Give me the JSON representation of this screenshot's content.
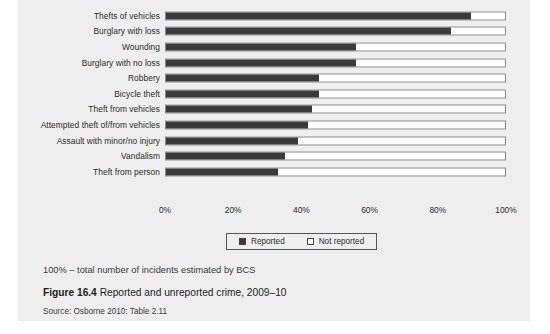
{
  "figure": {
    "note": "100% – total number of incidents estimated by BCS",
    "caption_number": "Figure 16.4",
    "caption_text": " Reported and unreported crime, 2009–10",
    "source": "Source: Osborne 2010: Table 2.11"
  },
  "legend": {
    "reported_label": "Reported",
    "not_reported_label": "Not reported"
  },
  "colors": {
    "reported": "#3b3b3b",
    "not_reported": "#ffffff",
    "panel": "#eeeeee",
    "bar_border": "#8a8a8a"
  },
  "chart_data": {
    "type": "bar",
    "orientation": "horizontal",
    "stacked": true,
    "title": "",
    "xlabel": "",
    "ylabel": "",
    "xlim": [
      0,
      100
    ],
    "grid": false,
    "legend_position": "bottom",
    "xticks": [
      "0%",
      "20%",
      "40%",
      "60%",
      "80%",
      "100%"
    ],
    "xtick_values": [
      0,
      20,
      40,
      60,
      80,
      100
    ],
    "categories": [
      "Thefts of vehicles",
      "Burglary with loss",
      "Wounding",
      "Burglary with no loss",
      "Robbery",
      "Bicycle theft",
      "Theft from vehicles",
      "Attempted theft of/from vehicles",
      "Assault with minor/no injury",
      "Vandalism",
      "Theft from person"
    ],
    "series": [
      {
        "name": "Reported",
        "values": [
          90,
          84,
          56,
          56,
          45,
          45,
          43,
          42,
          39,
          35,
          33
        ]
      },
      {
        "name": "Not reported",
        "values": [
          10,
          16,
          44,
          44,
          55,
          55,
          57,
          58,
          61,
          65,
          67
        ]
      }
    ]
  }
}
